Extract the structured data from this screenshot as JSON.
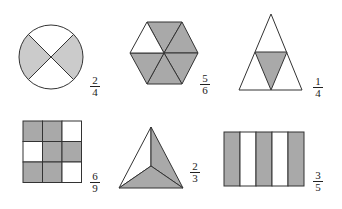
{
  "colors": {
    "stroke": "#333333",
    "shade_dark": "#a9a9a9",
    "shade_light": "#cbcbcb",
    "blank": "#ffffff"
  },
  "figures": [
    {
      "id": "circle",
      "shape": "circle divided into 4 sectors",
      "parts": 4,
      "shaded": 2,
      "shaded_parts": [
        "left",
        "right"
      ],
      "fraction": {
        "numerator": "2",
        "denominator": "4"
      }
    },
    {
      "id": "hexagon",
      "shape": "regular hexagon divided into 6 triangles",
      "parts": 6,
      "shaded": 5,
      "unshaded_parts": [
        "upper-left"
      ],
      "fraction": {
        "numerator": "5",
        "denominator": "6"
      }
    },
    {
      "id": "triangle",
      "shape": "triangle divided into 4 triangles",
      "parts": 4,
      "shaded": 1,
      "shaded_parts": [
        "center inverted triangle"
      ],
      "fraction": {
        "numerator": "1",
        "denominator": "4"
      }
    },
    {
      "id": "grid",
      "shape": "3x3 square grid",
      "parts": 9,
      "shaded": 6,
      "cells": [
        [
          1,
          1,
          0
        ],
        [
          0,
          1,
          1
        ],
        [
          1,
          1,
          0
        ]
      ],
      "fraction": {
        "numerator": "6",
        "denominator": "9"
      }
    },
    {
      "id": "tri-center",
      "shape": "triangle divided into 3 parts from center",
      "parts": 3,
      "shaded": 2,
      "shaded_parts": [
        "right",
        "bottom"
      ],
      "fraction": {
        "numerator": "2",
        "denominator": "3"
      }
    },
    {
      "id": "stripes",
      "shape": "rectangle divided into 5 vertical strips",
      "parts": 5,
      "shaded": 3,
      "strips": [
        1,
        0,
        1,
        0,
        1
      ],
      "fraction": {
        "numerator": "3",
        "denominator": "5"
      }
    }
  ]
}
